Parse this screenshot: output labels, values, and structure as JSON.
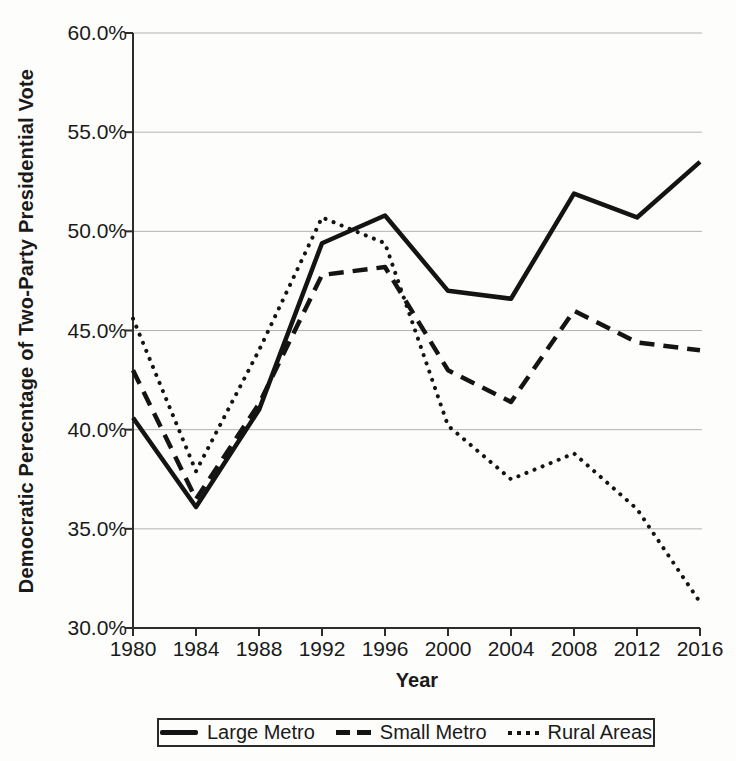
{
  "chart_data": {
    "type": "line",
    "title": "",
    "xlabel": "Year",
    "ylabel": "Democratic Perecntage of Two-Party Presidential Vote",
    "xlim": [
      1980,
      2016
    ],
    "ylim": [
      30,
      60
    ],
    "x": [
      1980,
      1984,
      1988,
      1992,
      1996,
      2000,
      2004,
      2008,
      2012,
      2016
    ],
    "x_tick_labels": [
      "1980",
      "1984",
      "1988",
      "1992",
      "1996",
      "2000",
      "2004",
      "2008",
      "2012",
      "2016"
    ],
    "y_tick_values": [
      60,
      55,
      50,
      45,
      40,
      35,
      30
    ],
    "y_tick_labels": [
      "60.0%",
      "55.0%",
      "50.0%",
      "45.0%",
      "40.0%",
      "35.0%",
      "30.0%"
    ],
    "grid": "horizontal gridlines on",
    "legend_position": "bottom",
    "line_color": "#141414",
    "series": [
      {
        "name": "Large Metro",
        "line_style": "solid",
        "values": [
          40.6,
          36.1,
          41.0,
          49.4,
          50.8,
          47.0,
          46.6,
          51.9,
          50.7,
          53.5
        ]
      },
      {
        "name": "Small Metro",
        "line_style": "dashed",
        "values": [
          43.0,
          36.5,
          41.3,
          47.8,
          48.2,
          43.0,
          41.4,
          46.0,
          44.4,
          44.0
        ]
      },
      {
        "name": "Rural Areas",
        "line_style": "dotted",
        "values": [
          45.6,
          37.9,
          44.0,
          50.7,
          49.4,
          40.2,
          37.5,
          38.8,
          36.0,
          31.3
        ]
      }
    ]
  }
}
